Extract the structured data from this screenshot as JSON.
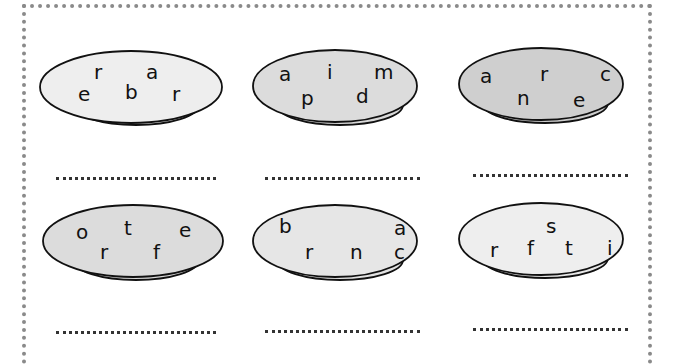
{
  "worksheet": {
    "plates": [
      {
        "letters": [
          "r",
          "a",
          "e",
          "b",
          "r"
        ],
        "fill": "#eeeeee",
        "answer": "................"
      },
      {
        "letters": [
          "a",
          "i",
          "m",
          "p",
          "d"
        ],
        "fill": "#dcdcdc",
        "answer": "................"
      },
      {
        "letters": [
          "a",
          "r",
          "c",
          "n",
          "e"
        ],
        "fill": "#cfcfcf",
        "answer": "................"
      },
      {
        "letters": [
          "o",
          "t",
          "e",
          "r",
          "f"
        ],
        "fill": "#dcdcdc",
        "answer": "................"
      },
      {
        "letters": [
          "b",
          "a",
          "r",
          "n",
          "c"
        ],
        "fill": "#e6e6e6",
        "answer": "................"
      },
      {
        "letters": [
          "s",
          "r",
          "f",
          "t",
          "i"
        ],
        "fill": "#eeeeee",
        "answer": "................"
      }
    ]
  }
}
